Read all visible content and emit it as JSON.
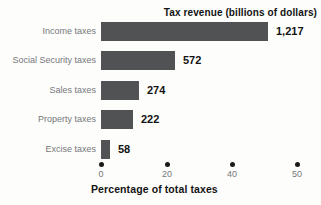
{
  "chart_data": {
    "type": "bar",
    "orientation": "horizontal",
    "title": "Tax revenue (billions of dollars)",
    "xlabel": "Percentage of total taxes",
    "categories": [
      "Income taxes",
      "Social Security taxes",
      "Sales taxes",
      "Property taxes",
      "Excise taxes"
    ],
    "values": [
      1217,
      572,
      274,
      222,
      58
    ],
    "value_labels": [
      "1,217",
      "572",
      "274",
      "222",
      "58"
    ],
    "x_ticks": [
      "0",
      "20",
      "40",
      "50"
    ],
    "xlim": [
      0,
      55
    ],
    "grid": false,
    "legend": "none",
    "bar_widths_px": [
      167,
      74,
      38,
      32,
      9
    ],
    "bar_start_px": 101,
    "colors": {
      "bar": "#515254",
      "category_label": "#77787b",
      "value_label": "#131313",
      "title": "#141414",
      "tick_dot": "#1a1a1a",
      "tick_label": "#77787b",
      "background": "#fdfdfb"
    }
  }
}
